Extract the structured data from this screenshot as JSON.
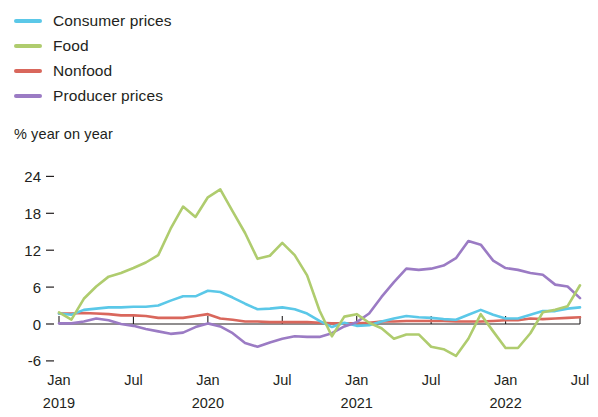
{
  "legend": {
    "position": "top-left",
    "items": [
      {
        "label": "Consumer prices",
        "color": "#5BC8E8",
        "key": "consumer_prices"
      },
      {
        "label": "Food",
        "color": "#AFCC6E",
        "key": "food"
      },
      {
        "label": "Nonfood",
        "color": "#D9675C",
        "key": "nonfood"
      },
      {
        "label": "Producer prices",
        "color": "#9B7BC4",
        "key": "producer_prices"
      }
    ]
  },
  "axis": {
    "unit_label": "% year on year",
    "y_ticks": [
      "24",
      "18",
      "12",
      "6",
      "0",
      "-6"
    ],
    "x_ticks": [
      "Jan",
      "Jul",
      "Jan",
      "Jul",
      "Jan",
      "Jul",
      "Jan",
      "Jul"
    ],
    "x_years": [
      "2019",
      "2020",
      "2021",
      "2022"
    ]
  },
  "chart_data": {
    "type": "line",
    "title": "",
    "subtitle": "",
    "xlabel": "",
    "ylabel": "% year on year",
    "ylim": [
      -6,
      24
    ],
    "ytick_values": [
      24,
      18,
      12,
      6,
      0,
      -6
    ],
    "xlim": [
      "2019-01",
      "2022-07"
    ],
    "grid": false,
    "legend_position": "top-left",
    "x": [
      "2019-01",
      "2019-02",
      "2019-03",
      "2019-04",
      "2019-05",
      "2019-06",
      "2019-07",
      "2019-08",
      "2019-09",
      "2019-10",
      "2019-11",
      "2019-12",
      "2020-01",
      "2020-02",
      "2020-03",
      "2020-04",
      "2020-05",
      "2020-06",
      "2020-07",
      "2020-08",
      "2020-09",
      "2020-10",
      "2020-11",
      "2020-12",
      "2021-01",
      "2021-02",
      "2021-03",
      "2021-04",
      "2021-05",
      "2021-06",
      "2021-07",
      "2021-08",
      "2021-09",
      "2021-10",
      "2021-11",
      "2021-12",
      "2022-01",
      "2022-02",
      "2022-03",
      "2022-04",
      "2022-05",
      "2022-06",
      "2022-07"
    ],
    "x_tick_labels": [
      {
        "index": 0,
        "label": "Jan",
        "year": "2019"
      },
      {
        "index": 6,
        "label": "Jul",
        "year": ""
      },
      {
        "index": 12,
        "label": "Jan",
        "year": "2020"
      },
      {
        "index": 18,
        "label": "Jul",
        "year": ""
      },
      {
        "index": 24,
        "label": "Jan",
        "year": "2021"
      },
      {
        "index": 30,
        "label": "Jul",
        "year": ""
      },
      {
        "index": 36,
        "label": "Jan",
        "year": "2022"
      },
      {
        "index": 42,
        "label": "Jul",
        "year": ""
      }
    ],
    "series": [
      {
        "name": "Consumer prices",
        "color": "#5BC8E8",
        "values": [
          1.7,
          1.5,
          2.3,
          2.5,
          2.7,
          2.7,
          2.8,
          2.8,
          3.0,
          3.8,
          4.5,
          4.5,
          5.4,
          5.2,
          4.3,
          3.3,
          2.4,
          2.5,
          2.7,
          2.4,
          1.7,
          0.5,
          -0.5,
          0.2,
          -0.3,
          -0.2,
          0.4,
          0.9,
          1.3,
          1.1,
          1.0,
          0.8,
          0.7,
          1.5,
          2.3,
          1.5,
          0.9,
          0.9,
          1.5,
          2.1,
          2.1,
          2.5,
          2.7
        ]
      },
      {
        "name": "Food",
        "color": "#AFCC6E",
        "values": [
          1.9,
          0.7,
          4.1,
          6.1,
          7.7,
          8.3,
          9.1,
          10.0,
          11.2,
          15.5,
          19.1,
          17.4,
          20.6,
          21.9,
          18.3,
          14.8,
          10.6,
          11.1,
          13.2,
          11.2,
          7.9,
          2.2,
          -2.0,
          1.2,
          1.6,
          0.2,
          -0.7,
          -2.4,
          -1.7,
          -1.7,
          -3.7,
          -4.1,
          -5.2,
          -2.4,
          1.6,
          -1.2,
          -3.9,
          -3.9,
          -1.5,
          1.9,
          2.3,
          2.9,
          6.3
        ]
      },
      {
        "name": "Nonfood",
        "color": "#D9675C",
        "values": [
          1.7,
          1.7,
          1.8,
          1.7,
          1.6,
          1.4,
          1.4,
          1.3,
          1.0,
          1.0,
          1.0,
          1.3,
          1.6,
          0.9,
          0.7,
          0.4,
          0.4,
          0.3,
          0.3,
          0.3,
          0.3,
          0.2,
          0.1,
          0.1,
          0.1,
          0.2,
          0.4,
          0.4,
          0.5,
          0.5,
          0.5,
          0.5,
          0.4,
          0.4,
          0.4,
          0.5,
          0.6,
          0.6,
          0.9,
          0.8,
          0.9,
          1.0,
          1.1
        ]
      },
      {
        "name": "Producer prices",
        "color": "#9B7BC4",
        "values": [
          0.1,
          0.1,
          0.4,
          0.9,
          0.6,
          0.0,
          -0.3,
          -0.8,
          -1.2,
          -1.6,
          -1.4,
          -0.5,
          0.1,
          -0.4,
          -1.5,
          -3.1,
          -3.7,
          -3.0,
          -2.4,
          -2.0,
          -2.1,
          -2.1,
          -1.5,
          -0.4,
          0.3,
          1.7,
          4.4,
          6.8,
          9.0,
          8.8,
          9.0,
          9.5,
          10.7,
          13.5,
          12.9,
          10.3,
          9.1,
          8.8,
          8.3,
          8.0,
          6.4,
          6.1,
          4.2
        ]
      }
    ]
  }
}
